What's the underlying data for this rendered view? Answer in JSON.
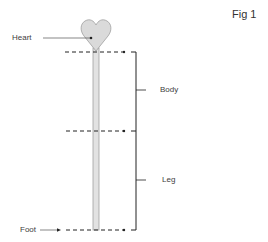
{
  "figure": {
    "title": "Fig 1",
    "labels": {
      "heart": "Heart",
      "body": "Body",
      "leg": "Leg",
      "foot": "Foot"
    },
    "colors": {
      "heart_fill": "#dcdcdc",
      "outline": "#9a9a9a",
      "stem_fill": "#e0e0e0",
      "line": "#222222",
      "text": "#404040"
    }
  }
}
